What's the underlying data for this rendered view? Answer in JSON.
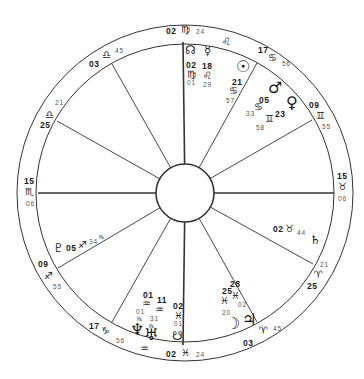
{
  "wheel": {
    "center": [
      185,
      193
    ],
    "outer_radius": 168,
    "ring_radius": 148,
    "hub_radius": 29,
    "line_color": "#333333"
  },
  "house_cusps": [
    {
      "name": "asc",
      "sign": "Scorpio",
      "glyph": "♏",
      "deg": "15",
      "min": "06",
      "end": [
        38,
        193
      ]
    },
    {
      "name": "ic",
      "sign": "Pisces",
      "glyph": "♓",
      "deg": "02",
      "min": "24",
      "end": [
        183,
        345
      ]
    },
    {
      "name": "dsc",
      "sign": "Taurus",
      "glyph": "♉",
      "deg": "15",
      "min": "06",
      "end": [
        334,
        193
      ]
    },
    {
      "name": "mc",
      "sign": "Virgo",
      "glyph": "♍",
      "deg": "02",
      "min": "24",
      "end": [
        183,
        42
      ]
    },
    {
      "name": "cusp-11",
      "sign": "Libra",
      "glyph": "♎",
      "deg": "03",
      "min": "45",
      "end": [
        112,
        64
      ]
    },
    {
      "name": "cusp-12",
      "sign": "Libra",
      "glyph": "♎",
      "deg": "25",
      "min": "21",
      "end": [
        57,
        121
      ]
    },
    {
      "name": "cusp-9",
      "sign": "Cancer",
      "glyph": "♋",
      "deg": "17",
      "min": "56",
      "end": [
        257,
        63
      ]
    },
    {
      "name": "cusp-8",
      "sign": "Gemini",
      "glyph": "♊",
      "deg": "09",
      "min": "55",
      "end": [
        312,
        120
      ]
    },
    {
      "name": "cusp-2",
      "sign": "Sagittarius",
      "glyph": "♐",
      "deg": "09",
      "min": "55",
      "end": [
        58,
        268
      ]
    },
    {
      "name": "cusp-3",
      "sign": "Capricorn",
      "glyph": "♑",
      "deg": "17",
      "min": "56",
      "end": [
        112,
        322
      ]
    },
    {
      "name": "cusp-5",
      "sign": "Aries",
      "glyph": "♈",
      "deg": "03",
      "min": "45",
      "end": [
        257,
        322
      ]
    },
    {
      "name": "cusp-6",
      "sign": "Aries",
      "glyph": "♈",
      "deg": "25",
      "min": "21",
      "end": [
        313,
        264
      ]
    }
  ],
  "labels": {
    "mc_deg": "02",
    "mc_sign": "♍",
    "mc_min": "24",
    "ic_deg": "02",
    "ic_sign": "♓",
    "ic_min": "24",
    "asc_deg": "15",
    "asc_sign": "♏",
    "asc_min": "06",
    "dsc_deg": "15",
    "dsc_sign": "♉",
    "dsc_min": "06",
    "c11_deg": "03",
    "c11_sign": "♎",
    "c11_min": "45",
    "c12_deg": "25",
    "c12_sign": "♎",
    "c12_min": "21",
    "c9_deg": "17",
    "c9_sign": "♋",
    "c9_min": "56",
    "c8_deg": "09",
    "c8_sign": "♊",
    "c8_min": "55",
    "c2_deg": "09",
    "c2_sign": "♐",
    "c2_min": "55",
    "c3_deg": "17",
    "c3_sign": "♑",
    "c3_min": "56",
    "c5_deg": "03",
    "c5_sign": "♈",
    "c5_min": "45",
    "c6_deg": "25",
    "c6_sign": "♈",
    "c6_min": "21",
    "intercepted_leo": "♌",
    "intercepted_aquarius": "♒"
  },
  "planets": {
    "north_node": {
      "glyph": "☊",
      "deg": "02",
      "sign": "♍",
      "min": "01"
    },
    "mercury": {
      "glyph": "☿",
      "deg": "18",
      "sign": "♌",
      "min": "29"
    },
    "sun": {
      "glyph": "☉",
      "deg": "21",
      "sign": "♋",
      "min": "57"
    },
    "mars": {
      "glyph": "♂"
    },
    "venus": {
      "glyph": "♀"
    },
    "mars_venus_pos": {
      "deg1": "05",
      "sign1": "♋",
      "min1": "33",
      "deg2": "23",
      "sign2": "♊",
      "min2": "58"
    },
    "saturn": {
      "glyph": "♄",
      "deg": "02",
      "sign": "♉",
      "min": "44"
    },
    "moon": {
      "glyph": "☽"
    },
    "jupiter": {
      "glyph": "♃"
    },
    "moon_jupiter_pos": {
      "deg1": "25",
      "sign1": "♓",
      "min1": "20",
      "deg2": "28",
      "sign2": "♓",
      "min2": "02"
    },
    "south_node": {
      "glyph": "☋",
      "deg": "02",
      "sign": "♓",
      "min": "01"
    },
    "uranus": {
      "glyph": "♅",
      "deg": "11",
      "sign": "♒",
      "min": "31",
      "retro": "℞"
    },
    "neptune": {
      "glyph": "♆",
      "deg": "01",
      "sign": "♒",
      "min": "01",
      "retro": "℞"
    },
    "pluto": {
      "glyph": "♇",
      "deg": "05",
      "sign": "♐",
      "min": "34",
      "retro": "℞"
    }
  }
}
